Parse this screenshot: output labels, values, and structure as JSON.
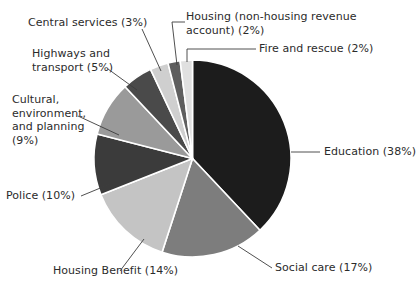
{
  "chart_data": {
    "type": "pie",
    "title": "",
    "subtitle": "",
    "xlabel": "",
    "ylabel": "",
    "legend_position": "none",
    "grid": false,
    "units": "percent",
    "categories": [
      "Education",
      "Social care",
      "Housing Benefit",
      "Police",
      "Cultural, environment, and planning",
      "Highways and transport",
      "Central services",
      "Housing (non-housing revenue account)",
      "Fire and rescue"
    ],
    "values": [
      38,
      17,
      14,
      10,
      9,
      5,
      3,
      2,
      2
    ],
    "colors": [
      "#1c1c1c",
      "#7d7d7d",
      "#c4c4c4",
      "#3b3b3b",
      "#9a9a9a",
      "#4a4a4a",
      "#cfcfcf",
      "#5e5e5e",
      "#e0e0e0"
    ],
    "start_angle_deg": 0,
    "direction": "clockwise",
    "slices": [
      {
        "label": "Education (38%)",
        "name": "Education",
        "value": 38,
        "color": "#1c1c1c"
      },
      {
        "label": "Social care (17%)",
        "name": "Social care",
        "value": 17,
        "color": "#7d7d7d"
      },
      {
        "label": "Housing Benefit (14%)",
        "name": "Housing Benefit",
        "value": 14,
        "color": "#c4c4c4"
      },
      {
        "label": "Police (10%)",
        "name": "Police",
        "value": 10,
        "color": "#3b3b3b"
      },
      {
        "label": "Cultural, environment, and planning (9%)",
        "name": "Cultural, environment, and planning",
        "value": 9,
        "color": "#9a9a9a"
      },
      {
        "label": "Highways and transport (5%)",
        "name": "Highways and transport",
        "value": 5,
        "color": "#4a4a4a"
      },
      {
        "label": "Central services (3%)",
        "name": "Central services",
        "value": 3,
        "color": "#cfcfcf"
      },
      {
        "label": "Housing (non-housing revenue account) (2%)",
        "name": "Housing (non-housing revenue account)",
        "value": 2,
        "color": "#5e5e5e"
      },
      {
        "label": "Fire and rescue (2%)",
        "name": "Fire and rescue",
        "value": 2,
        "color": "#e0e0e0"
      }
    ]
  },
  "labels": {
    "education": "Education (38%)",
    "social_care": "Social care (17%)",
    "housing_benefit": "Housing Benefit (14%)",
    "police": "Police (10%)",
    "cultural": "Cultural,\nenvironment,\nand planning\n(9%)",
    "highways": "Highways and\ntransport (5%)",
    "central_services": "Central services (3%)",
    "housing_hra": "Housing (non-housing revenue\naccount) (2%)",
    "fire_rescue": "Fire and rescue (2%)"
  }
}
